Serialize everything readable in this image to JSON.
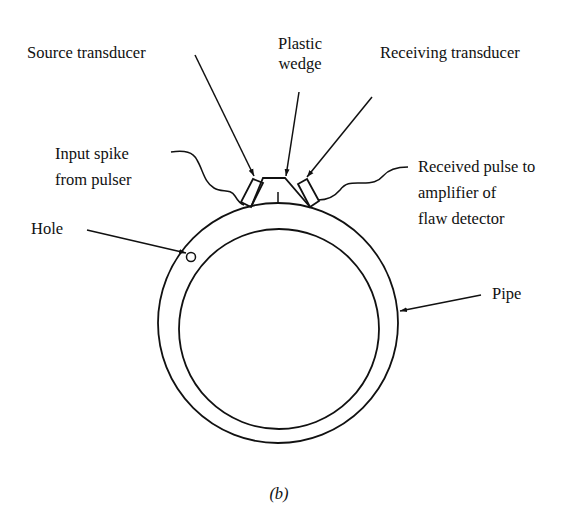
{
  "figure": {
    "caption": "(b)",
    "labels": {
      "plastic_wedge_line1": "Plastic",
      "plastic_wedge_line2": "wedge",
      "source_transducer": "Source transducer",
      "receiving_transducer": "Receiving transducer",
      "input_spike_line1": "Input spike",
      "input_spike_line2": "from pulser",
      "received_pulse_line1": "Received pulse to",
      "received_pulse_line2": "amplifier of",
      "received_pulse_line3": "flaw detector",
      "hole": "Hole",
      "pipe": "Pipe"
    },
    "colors": {
      "ink": "#111111",
      "background": "#ffffff"
    }
  }
}
